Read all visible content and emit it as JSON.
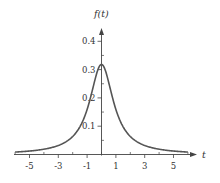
{
  "chart_data": {
    "type": "line",
    "title": "",
    "xlabel": "t",
    "ylabel": "f(t)",
    "xlim": [
      -6,
      6.5
    ],
    "ylim": [
      0,
      0.43
    ],
    "x_ticks_labeled": [
      -5,
      -3,
      -1,
      1,
      3,
      5
    ],
    "x_ticks_minor": [
      -6,
      -4,
      -2,
      0,
      2,
      4,
      6
    ],
    "y_ticks_labeled": [
      0.1,
      0.2,
      0.3,
      0.4
    ],
    "y_ticks_minor": [
      0.05,
      0.15,
      0.25,
      0.35
    ],
    "x_tick_labels": [
      "-5",
      "-3",
      "-1",
      "1",
      "3",
      "5"
    ],
    "y_tick_labels": [
      "0.1",
      "0.2",
      "0.3",
      "0.4"
    ],
    "grid": false,
    "legend": null,
    "function": "f(t) = 1 / (pi * (1 + t^2))",
    "series": [
      {
        "name": "f(t)",
        "x": [
          -6,
          -5,
          -4,
          -3,
          -2,
          -1.5,
          -1,
          -0.5,
          0,
          0.5,
          1,
          1.5,
          2,
          3,
          4,
          5,
          6
        ],
        "values": [
          0.0086,
          0.0122,
          0.0187,
          0.0318,
          0.0637,
          0.0979,
          0.1592,
          0.2546,
          0.3183,
          0.2546,
          0.1592,
          0.0979,
          0.0637,
          0.0318,
          0.0187,
          0.0122,
          0.0086
        ]
      }
    ],
    "peak": {
      "x": 0,
      "y": 0.318
    }
  },
  "axes": {
    "x_label": "t",
    "y_label": "f(t)"
  },
  "colors": {
    "curve": "#555555",
    "axis": "#444444",
    "text": "#333333"
  }
}
